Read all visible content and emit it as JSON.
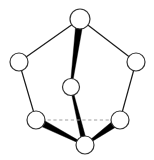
{
  "figure": {
    "title": "",
    "background_color": "#ffffff",
    "width": 154,
    "height": 160
  },
  "chart_data": {
    "type": "diagram",
    "subtype": "node-link-graph",
    "title": "",
    "xlabel": "",
    "ylabel": "",
    "node_style": {
      "fill_color": "#ffffff",
      "stroke_color": "#333333",
      "stroke_width": 1.2,
      "radius": 9
    },
    "nodes": [
      {
        "id": "n-top",
        "label": "",
        "x": 80,
        "y": 19,
        "r": 10
      },
      {
        "id": "n-left",
        "label": "",
        "x": 19,
        "y": 62,
        "r": 9
      },
      {
        "id": "n-right",
        "label": "",
        "x": 136,
        "y": 62,
        "r": 9
      },
      {
        "id": "n-center",
        "label": "",
        "x": 71,
        "y": 87,
        "r": 8.5
      },
      {
        "id": "n-bottom-left",
        "label": "",
        "x": 36,
        "y": 120,
        "r": 9
      },
      {
        "id": "n-bottom-right",
        "label": "",
        "x": 120,
        "y": 120,
        "r": 9
      },
      {
        "id": "n-bottom",
        "label": "",
        "x": 85,
        "y": 145,
        "r": 9
      }
    ],
    "edges": [
      {
        "id": "e-top-left",
        "source": "n-top",
        "target": "n-left",
        "style": "thin",
        "color": "#1a1a1a",
        "width": 1.2
      },
      {
        "id": "e-top-right",
        "source": "n-top",
        "target": "n-right",
        "style": "thin",
        "color": "#1a1a1a",
        "width": 1.2
      },
      {
        "id": "e-left-bottomleft",
        "source": "n-left",
        "target": "n-bottom-left",
        "style": "thin",
        "color": "#1a1a1a",
        "width": 1.2
      },
      {
        "id": "e-right-bottomright",
        "source": "n-right",
        "target": "n-bottom-right",
        "style": "thin",
        "color": "#1a1a1a",
        "width": 1.2
      },
      {
        "id": "e-bottomright-bottom",
        "source": "n-bottom-right",
        "target": "n-bottom",
        "style": "thick-taper",
        "color": "#000000",
        "start_width": 7,
        "end_width": 2
      },
      {
        "id": "e-bottomleft-bottom",
        "source": "n-bottom-left",
        "target": "n-bottom",
        "style": "thick-taper",
        "color": "#000000",
        "start_width": 7,
        "end_width": 2
      },
      {
        "id": "e-top-center",
        "source": "n-top",
        "target": "n-center",
        "style": "thick-taper",
        "color": "#000000",
        "start_width": 7,
        "end_width": 2
      },
      {
        "id": "e-center-bottom",
        "source": "n-center",
        "target": "n-bottom",
        "style": "thick-taper",
        "color": "#000000",
        "start_width": 2,
        "end_width": 5
      },
      {
        "id": "e-bottomleft-bottomright",
        "source": "n-bottom-left",
        "target": "n-bottom-right",
        "style": "dashed",
        "color": "#a0a0a0",
        "width": 1.2
      }
    ],
    "legend": {
      "entries": [],
      "position": "none"
    },
    "grid": false
  }
}
